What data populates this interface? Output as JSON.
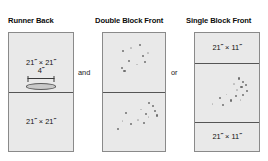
{
  "figure": {
    "background_color": "#ffffff",
    "panel_fill_color": "#e9e9e9",
    "panel_border_color": "#8a8a8a",
    "seam_line_color": "#555555",
    "speckle_color": "#6f6f6f"
  },
  "panels": [
    {
      "id": "runner-back",
      "heading": "Runner Back",
      "sections": [
        {
          "id": "rb-top",
          "label": "21˝ × 21˝"
        },
        {
          "id": "rb-bottom",
          "label": "21˝ × 21˝"
        }
      ],
      "opening": {
        "measure_label": "4˝",
        "shape": "ellipse-slit-icon"
      }
    },
    {
      "id": "double-block-front",
      "heading": "Double Block Front",
      "sections": [
        {
          "id": "db-top",
          "label": ""
        },
        {
          "id": "db-bottom",
          "label": ""
        }
      ],
      "speckles": {
        "top": [
          [
            58,
            18
          ],
          [
            31,
            28
          ],
          [
            71,
            33
          ],
          [
            63,
            37
          ],
          [
            40,
            46
          ],
          [
            54,
            52
          ],
          [
            29,
            58
          ],
          [
            33,
            62
          ],
          [
            44,
            24
          ],
          [
            66,
            48
          ]
        ],
        "bottom": [
          [
            73,
            16
          ],
          [
            79,
            21
          ],
          [
            60,
            27
          ],
          [
            82,
            29
          ],
          [
            67,
            35
          ],
          [
            72,
            40
          ],
          [
            85,
            37
          ],
          [
            35,
            33
          ],
          [
            30,
            47
          ],
          [
            43,
            52
          ],
          [
            22,
            60
          ],
          [
            55,
            45
          ],
          [
            64,
            50
          ]
        ]
      }
    },
    {
      "id": "single-block-front",
      "heading": "Single Block Front",
      "sections": [
        {
          "id": "sb-top",
          "label": "21˝ × 11˝"
        },
        {
          "id": "sb-middle",
          "label": ""
        },
        {
          "id": "sb-bottom",
          "label": "21˝ × 11˝"
        }
      ],
      "speckles": {
        "middle": [
          [
            67,
            24
          ],
          [
            74,
            30
          ],
          [
            60,
            34
          ],
          [
            71,
            38
          ],
          [
            78,
            36
          ],
          [
            64,
            44
          ],
          [
            80,
            46
          ],
          [
            74,
            52
          ],
          [
            48,
            52
          ],
          [
            38,
            58
          ],
          [
            55,
            62
          ],
          [
            26,
            68
          ],
          [
            42,
            70
          ],
          [
            62,
            54
          ],
          [
            70,
            62
          ]
        ]
      }
    }
  ],
  "connectors": [
    {
      "id": "and",
      "label": "and"
    },
    {
      "id": "or",
      "label": "or"
    }
  ]
}
